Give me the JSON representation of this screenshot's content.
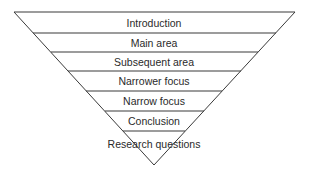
{
  "diagram": {
    "type": "inverted-triangle-funnel",
    "levels": [
      {
        "label": "Introduction"
      },
      {
        "label": "Main area"
      },
      {
        "label": "Subsequent area"
      },
      {
        "label": "Narrower focus"
      },
      {
        "label": "Narrow focus"
      },
      {
        "label": "Conclusion"
      },
      {
        "label": "Research questions"
      }
    ]
  }
}
